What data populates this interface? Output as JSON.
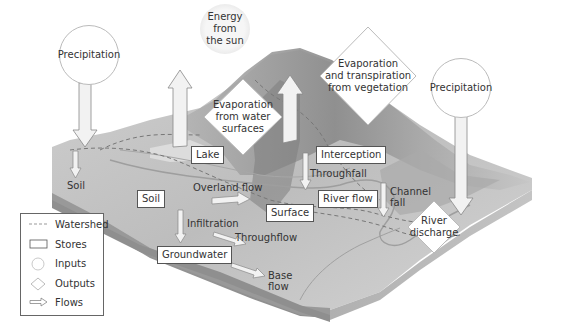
{
  "diagram": {
    "colors": {
      "terrain_top": "#c8c8c8",
      "terrain_dark": "#8c8c8c",
      "terrain_side": "#9a9a9a",
      "arrow_fill": "#f0f0f0",
      "arrow_stroke": "#888888",
      "watershed": "#7a7a7a"
    },
    "inputs": {
      "precipitation_left": "Precipitation",
      "energy_sun": [
        "Energy",
        "from",
        "the sun"
      ],
      "precipitation_right": "Precipitation"
    },
    "outputs": {
      "evap_water": [
        "Evaporation",
        "from water",
        "surfaces"
      ],
      "evap_veg": [
        "Evaporation",
        "and transpiration",
        "from vegetation"
      ],
      "river_discharge": [
        "River",
        "discharge"
      ]
    },
    "stores": {
      "lake": "Lake",
      "interception": "Interception",
      "soil": "Soil",
      "surface": "Surface",
      "river_flow": "River flow",
      "groundwater": "Groundwater"
    },
    "flows": {
      "soil_left": "Soil",
      "throughfall": "Throughfall",
      "overland_flow": "Overland flow",
      "infiltration": "Infiltration",
      "throughflow": "Throughflow",
      "channel_fall": [
        "Channel",
        "fall"
      ],
      "base_flow": [
        "Base",
        "flow"
      ]
    },
    "legend": {
      "items": [
        {
          "symbol": "dashed-line",
          "label": "Watershed"
        },
        {
          "symbol": "rectangle",
          "label": "Stores"
        },
        {
          "symbol": "circle",
          "label": "Inputs"
        },
        {
          "symbol": "diamond",
          "label": "Outputs"
        },
        {
          "symbol": "arrow",
          "label": "Flows"
        }
      ]
    }
  }
}
